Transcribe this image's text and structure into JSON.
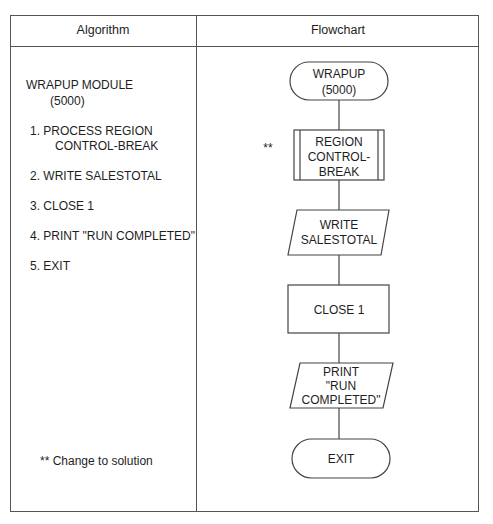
{
  "header": {
    "col1": "Algorithm",
    "col2": "Flowchart"
  },
  "algorithm": {
    "title": "WRAPUP MODULE",
    "module_number": "(5000)",
    "steps": [
      {
        "line1": "1. PROCESS REGION",
        "line2": "CONTROL-BREAK"
      },
      {
        "line1": "2. WRITE SALESTOTAL"
      },
      {
        "line1": "3. CLOSE 1"
      },
      {
        "line1": "4. PRINT \"RUN COMPLETED\""
      },
      {
        "line1": "5. EXIT"
      }
    ],
    "footnote": "** Change to solution"
  },
  "flowchart": {
    "start": {
      "line1": "WRAPUP",
      "line2": "(5000)",
      "shape": "terminal"
    },
    "process1": {
      "marker": "**",
      "line1": "REGION",
      "line2": "CONTROL-",
      "line3": "BREAK",
      "shape": "predefined-process"
    },
    "io1": {
      "line1": "WRITE",
      "line2": "SALESTOTAL",
      "shape": "input-output"
    },
    "process2": {
      "line1": "CLOSE 1",
      "shape": "process"
    },
    "io2": {
      "line1": "PRINT",
      "line2": "\"RUN",
      "line3": "COMPLETED\"",
      "shape": "input-output"
    },
    "end": {
      "line1": "EXIT",
      "shape": "terminal"
    }
  }
}
